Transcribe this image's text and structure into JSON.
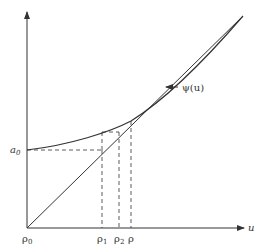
{
  "diagram": {
    "curve_label": "ψ(u)",
    "x_axis_label": "u",
    "y_axis_label": "a",
    "y_axis_label_subscript": "0",
    "x_ticks": [
      {
        "label": "ρ",
        "subscript": "0"
      },
      {
        "label": "ρ",
        "subscript": "1"
      },
      {
        "label": "ρ",
        "subscript": "2"
      },
      {
        "label": "ρ",
        "subscript": ""
      }
    ],
    "colors": {
      "line": "#333333",
      "background": "#ffffff"
    }
  }
}
